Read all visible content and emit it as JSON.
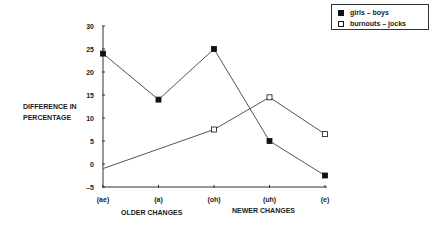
{
  "chart_data": {
    "type": "line",
    "title": "",
    "xlabel": "",
    "ylabel": "DIFFERENCE IN PERCENTAGE",
    "ylabel_lines": [
      "DIFFERENCE IN",
      "PERCENTAGE"
    ],
    "categories": [
      "(ae)",
      "(a)",
      "(oh)",
      "(uh)",
      "(e)"
    ],
    "x_group_labels": [
      "OLDER CHANGES",
      "NEWER CHANGES"
    ],
    "yticks": [
      30,
      25,
      20,
      15,
      10,
      5,
      0,
      -5
    ],
    "ylim": [
      -5,
      30
    ],
    "grid": false,
    "legend_position": "top-right",
    "series": [
      {
        "name": "girls – boys",
        "marker": "filled-square",
        "values": [
          24,
          14,
          25,
          5,
          -2.5
        ]
      },
      {
        "name": "burnouts – jocks",
        "marker": "open-square",
        "values": [
          -1,
          null,
          7.5,
          14.5,
          6.5
        ]
      }
    ]
  },
  "legend": {
    "items": [
      {
        "label": "girls – boys"
      },
      {
        "label": "burnouts – jocks"
      }
    ]
  }
}
